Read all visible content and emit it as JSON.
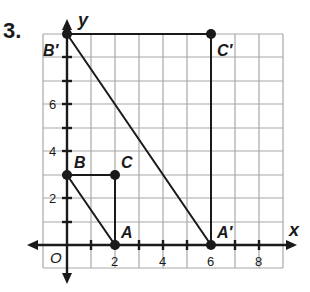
{
  "problem_number": "3.",
  "colors": {
    "grid": "#a8a8a8",
    "ink": "#1a1a1a",
    "background": "#ffffff"
  },
  "axes": {
    "x_label": "x",
    "y_label": "y",
    "origin_label": "O",
    "x_ticks": [
      "2",
      "4",
      "6",
      "8"
    ],
    "y_ticks": [
      "2",
      "4",
      "6"
    ],
    "x_range": [
      -1,
      9
    ],
    "y_range": [
      -1,
      9
    ]
  },
  "points": [
    {
      "label": "A",
      "x": 2,
      "y": 0
    },
    {
      "label": "B",
      "x": 0,
      "y": 3
    },
    {
      "label": "C",
      "x": 2,
      "y": 3
    },
    {
      "label": "A′",
      "x": 6,
      "y": 0
    },
    {
      "label": "B′",
      "x": 0,
      "y": 9
    },
    {
      "label": "C′",
      "x": 6,
      "y": 9
    }
  ],
  "triangles": [
    {
      "name": "ABC",
      "vertices": [
        "A",
        "B",
        "C"
      ]
    },
    {
      "name": "A′B′C′",
      "vertices": [
        "A′",
        "B′",
        "C′"
      ]
    }
  ]
}
